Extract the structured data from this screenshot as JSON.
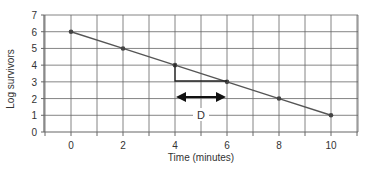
{
  "chart_data": {
    "type": "line",
    "title": "",
    "xlabel": "Time (minutes)",
    "ylabel": "Log survivors",
    "x": [
      0,
      2,
      4,
      6,
      8,
      10
    ],
    "series": [
      {
        "name": "Log survivors",
        "values": [
          6,
          5,
          4,
          3,
          2,
          1
        ]
      }
    ],
    "xticks": [
      "0",
      "2",
      "4",
      "6",
      "8",
      "10"
    ],
    "yticks": [
      "0",
      "1",
      "2",
      "3",
      "4",
      "5",
      "6",
      "7"
    ],
    "xlim": [
      -1,
      11
    ],
    "ylim": [
      0,
      7
    ],
    "grid": true,
    "annotation": {
      "label": "D",
      "from_x": 4,
      "to_x": 6,
      "description": "D-value: time for one log reduction"
    },
    "colors": {
      "line": "#555555",
      "grid": "#666666",
      "arrow": "#111111"
    }
  }
}
